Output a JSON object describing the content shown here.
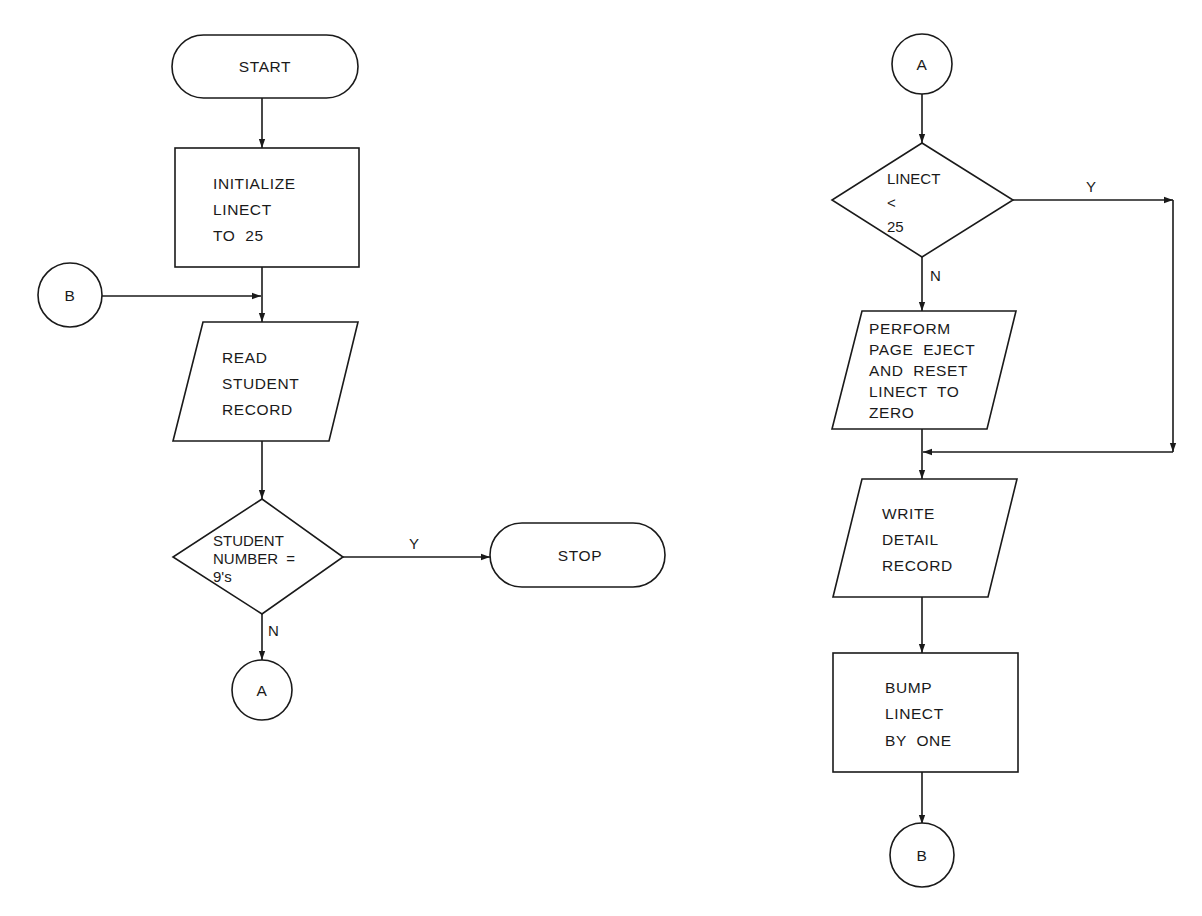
{
  "flowchart_left": {
    "start": {
      "label": "START"
    },
    "init": {
      "lines": [
        "INITIALIZE",
        "LINECT",
        "TO  25"
      ]
    },
    "connector_b_in": {
      "label": "B"
    },
    "read": {
      "lines": [
        "READ",
        "STUDENT",
        "RECORD"
      ]
    },
    "decision": {
      "lines": [
        "STUDENT",
        "NUMBER  =",
        "9's"
      ],
      "yes_label": "Y",
      "no_label": "N"
    },
    "stop": {
      "label": "STOP"
    },
    "connector_a_out": {
      "label": "A"
    }
  },
  "flowchart_right": {
    "connector_a_in": {
      "label": "A"
    },
    "decision": {
      "lines": [
        "LINECT",
        "<",
        "25"
      ],
      "yes_label": "Y",
      "no_label": "N"
    },
    "page_eject": {
      "lines": [
        "PERFORM",
        "PAGE  EJECT",
        "AND  RESET",
        "LINECT  TO",
        "ZERO"
      ]
    },
    "write": {
      "lines": [
        "WRITE",
        "DETAIL",
        "RECORD"
      ]
    },
    "bump": {
      "lines": [
        "BUMP",
        "LINECT",
        "BY  ONE"
      ]
    },
    "connector_b_out": {
      "label": "B"
    }
  },
  "colors": {
    "stroke": "#1a1a1a",
    "background": "#ffffff"
  }
}
